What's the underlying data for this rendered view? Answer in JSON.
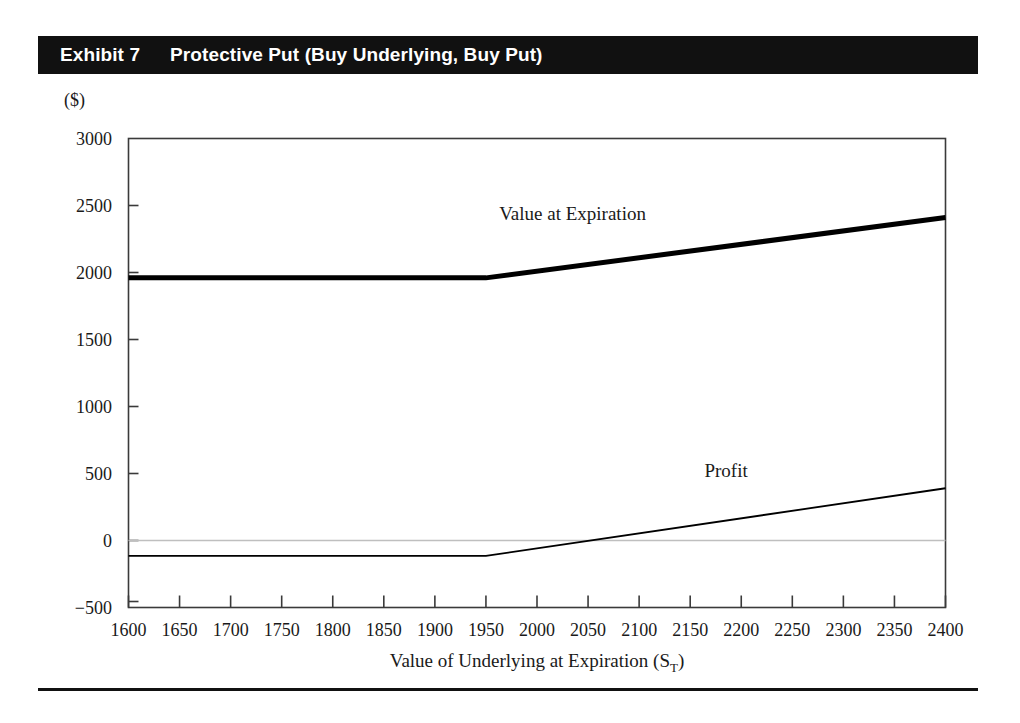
{
  "header": {
    "exhibit_label": "Exhibit 7",
    "title": "Protective Put (Buy Underlying, Buy Put)"
  },
  "chart_data": {
    "type": "line",
    "title": "Protective Put (Buy Underlying, Buy Put)",
    "unit_label": "($)",
    "xlabel": "Value of Underlying at Expiration (S_T)",
    "xlabel_main": "Value of Underlying at Expiration  (S",
    "xlabel_sub": "T",
    "xlabel_tail": ")",
    "ylabel": "($)",
    "xlim": [
      1600,
      2400
    ],
    "ylim": [
      -500,
      3000
    ],
    "grid": false,
    "legend_position": "inline-annotations",
    "x_ticks": [
      1600,
      1650,
      1700,
      1750,
      1800,
      1850,
      1900,
      1950,
      2000,
      2050,
      2100,
      2150,
      2200,
      2250,
      2300,
      2350,
      2400
    ],
    "y_ticks": [
      3000,
      2500,
      2000,
      1500,
      1000,
      500,
      0,
      -500
    ],
    "y_tick_labels": [
      "3000",
      "2500",
      "2000",
      "1500",
      "1000",
      "500",
      "0",
      "−500"
    ],
    "zero_line": 0,
    "strike": 1950,
    "series": [
      {
        "name": "Value at Expiration",
        "style": "thick",
        "color": "#000000",
        "x": [
          1600,
          1950,
          2400
        ],
        "values": [
          1960,
          1960,
          2410
        ]
      },
      {
        "name": "Profit",
        "style": "thin",
        "color": "#000000",
        "x": [
          1600,
          1950,
          2400
        ],
        "values": [
          -115,
          -115,
          390
        ]
      }
    ],
    "annotations": [
      {
        "text": "Value at Expiration",
        "x": 2035,
        "y": 2430
      },
      {
        "text": "Profit",
        "x": 2185,
        "y": 510
      }
    ]
  }
}
